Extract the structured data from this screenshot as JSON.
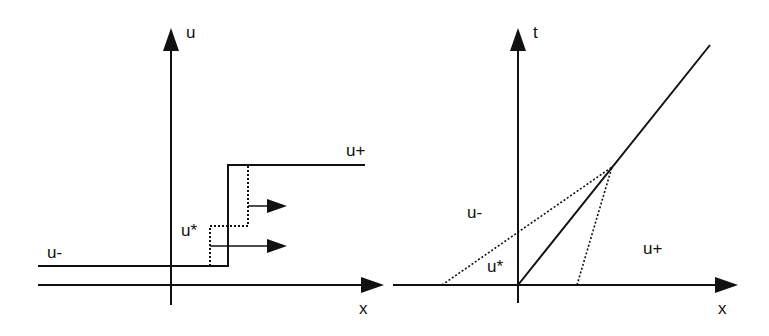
{
  "left_panel": {
    "vertical_axis_label": "u",
    "horizontal_axis_label": "x",
    "left_state_label": "u-",
    "right_state_label": "u+",
    "intermediate_state_label": "u*"
  },
  "right_panel": {
    "vertical_axis_label": "t",
    "horizontal_axis_label": "x",
    "left_region_label": "u-",
    "right_region_label": "u+",
    "intermediate_region_label": "u*"
  },
  "colors": {
    "line": "#111111",
    "background": "#ffffff"
  }
}
